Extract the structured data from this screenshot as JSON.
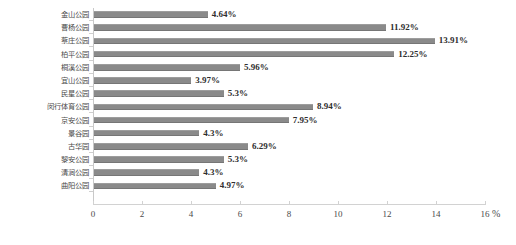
{
  "chart_data": {
    "type": "bar",
    "orientation": "horizontal",
    "title": "",
    "subtitle": "",
    "xlabel": "%",
    "ylabel": "",
    "xlim": [
      0,
      16
    ],
    "xticks": [
      0,
      2,
      4,
      6,
      8,
      10,
      12,
      14,
      16
    ],
    "xtick_labels": [
      "0",
      "2",
      "4",
      "6",
      "8",
      "10",
      "12",
      "14",
      "16"
    ],
    "grid": false,
    "legend": null,
    "bar_color": "#8a8a8a",
    "value_label_suffix": "%",
    "categories": [
      "金山公园",
      "曹杨公园",
      "蔡庄公园",
      "柏平公园",
      "桐溪公园",
      "宜山公园",
      "民星公园",
      "闵行体育公园",
      "京安公园",
      "景谷园",
      "古华园",
      "黎安公园",
      "清涧公园",
      "曲阳公园"
    ],
    "values": [
      4.64,
      11.92,
      13.91,
      12.25,
      5.96,
      3.97,
      5.3,
      8.94,
      7.95,
      4.3,
      6.29,
      5.3,
      4.3,
      4.97
    ],
    "value_labels": [
      "4.64%",
      "11.92%",
      "13.91%",
      "12.25%",
      "5.96%",
      "3.97%",
      "5.3%",
      "8.94%",
      "7.95%",
      "4.3%",
      "6.29%",
      "5.3%",
      "4.3%",
      "4.97%"
    ]
  }
}
